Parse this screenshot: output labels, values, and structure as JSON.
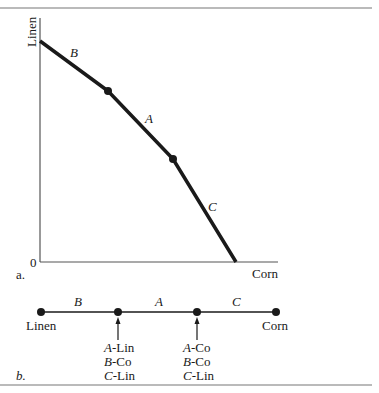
{
  "figure": {
    "panel_a": {
      "label": "a.",
      "y_axis_label": "Linen",
      "x_axis_label": "Corn",
      "origin_label": "0",
      "segments": [
        {
          "name": "B"
        },
        {
          "name": "A"
        },
        {
          "name": "C"
        }
      ]
    },
    "panel_b": {
      "label": "b.",
      "left_end_label": "Linen",
      "right_end_label": "Corn",
      "segments": [
        {
          "name": "B"
        },
        {
          "name": "A"
        },
        {
          "name": "C"
        }
      ],
      "kink1": {
        "lines": [
          {
            "country": "A",
            "good": "-Lin"
          },
          {
            "country": "B",
            "good": "-Co"
          },
          {
            "country": "C",
            "good": "-Lin"
          }
        ]
      },
      "kink2": {
        "lines": [
          {
            "country": "A",
            "good": "-Co"
          },
          {
            "country": "B",
            "good": "-Co"
          },
          {
            "country": "C",
            "good": "-Lin"
          }
        ]
      }
    }
  },
  "colors": {
    "ink": "#1a1a1a",
    "axis": "#555555",
    "rule": "#777777"
  }
}
